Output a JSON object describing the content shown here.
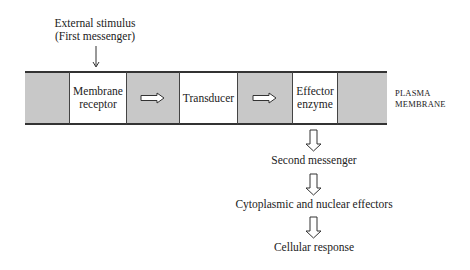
{
  "stimulus": {
    "line1": "External stimulus",
    "line2": "(First messenger)"
  },
  "membrane": {
    "label_line1": "PLASMA",
    "label_line2": "MEMBRANE",
    "band_color": "#c8c8c8",
    "boxes": [
      {
        "line1": "Membrane",
        "line2": "receptor"
      },
      {
        "line1": "Transducer",
        "line2": ""
      },
      {
        "line1": "Effector",
        "line2": "enzyme"
      }
    ]
  },
  "cascade": [
    {
      "label": "Second messenger"
    },
    {
      "label": "Cytoplasmic and nuclear effectors"
    },
    {
      "label": "Cellular response"
    }
  ]
}
